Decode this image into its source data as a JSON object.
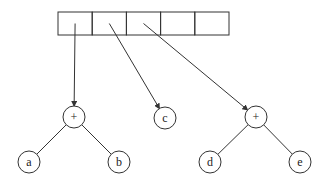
{
  "diagram": {
    "array": {
      "x": 58,
      "y": 12,
      "cell_width": 34.2,
      "height": 23,
      "cells": [
        "",
        "",
        "",
        "",
        ""
      ]
    },
    "nodes": [
      {
        "id": "plus1",
        "label": "+",
        "x": 74,
        "y": 117
      },
      {
        "id": "a",
        "label": "a",
        "x": 29,
        "y": 162
      },
      {
        "id": "b",
        "label": "b",
        "x": 119,
        "y": 162
      },
      {
        "id": "c",
        "label": "c",
        "x": 165,
        "y": 118
      },
      {
        "id": "plus2",
        "label": "+",
        "x": 256,
        "y": 117
      },
      {
        "id": "d",
        "label": "d",
        "x": 210,
        "y": 162
      },
      {
        "id": "e",
        "label": "e",
        "x": 300,
        "y": 162
      }
    ],
    "pointers": [
      {
        "from_cell": 0,
        "to": "plus1"
      },
      {
        "from_cell": 1,
        "to": "c"
      },
      {
        "from_cell": 2,
        "to": "plus2"
      }
    ],
    "edges": [
      {
        "from": "plus1",
        "to": "a"
      },
      {
        "from": "plus1",
        "to": "b"
      },
      {
        "from": "plus2",
        "to": "d"
      },
      {
        "from": "plus2",
        "to": "e"
      }
    ],
    "colors": {
      "stroke": "#333333",
      "background": "#ffffff"
    }
  }
}
